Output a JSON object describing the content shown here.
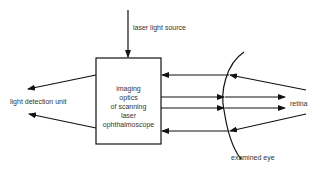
{
  "diagram": {
    "labels": {
      "source": "laser light source",
      "box_line1": "imaging",
      "box_line2": "optics",
      "box_line3": "of scanning",
      "box_line4": "laser",
      "box_line5": "ophthalmoscope",
      "detector": "light detection unit",
      "retina": "retina",
      "eye": "examined eye"
    },
    "colors": {
      "stroke": "#111111",
      "text": "#333333",
      "background": "#ffffff"
    }
  }
}
